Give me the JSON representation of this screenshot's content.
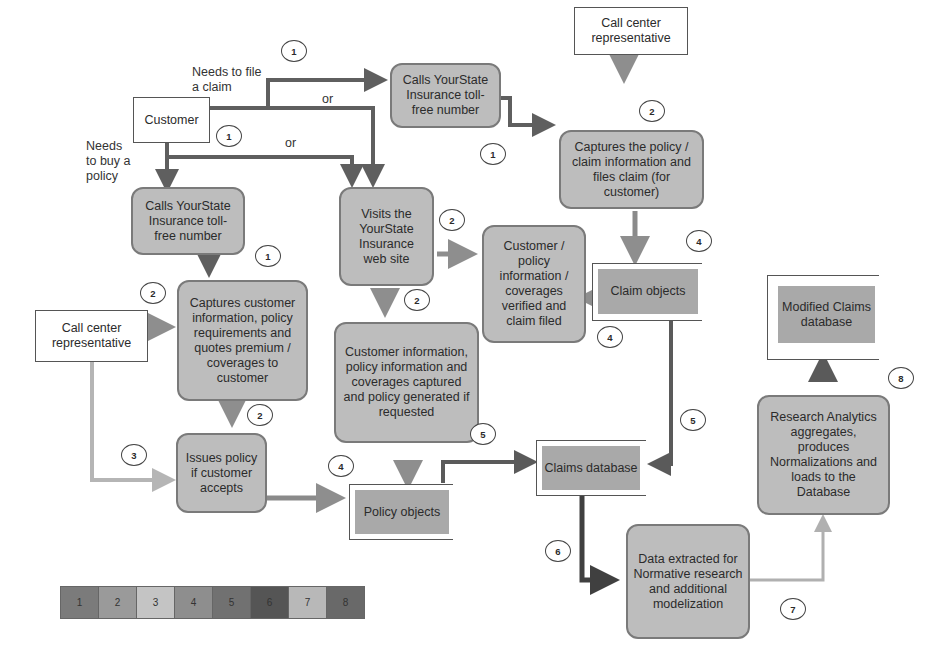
{
  "actors": {
    "customer": "Customer",
    "call_center_top": "Call center representative",
    "call_center_left": "Call center representative"
  },
  "labels": {
    "needs_claim": "Needs to file a claim",
    "needs_policy": "Needs to buy a policy",
    "or_top": "or",
    "or_bottom": "or"
  },
  "processes": {
    "calls_claim": "Calls YourState Insurance toll-free number",
    "captures_claim": "Captures the policy / claim information and files claim (for customer)",
    "calls_policy": "Calls YourState Insurance toll-free number",
    "visits_web": "Visits the YourState Insurance web site",
    "verified_claim": "Customer / policy information / coverages verified and claim filed",
    "captures_customer": "Captures customer information, policy requirements and quotes premium / coverages to customer",
    "web_captured": "Customer information, policy information and coverages captured and policy generated if requested",
    "issues_policy": "Issues policy if customer accepts",
    "data_extracted": "Data extracted for Normative research and additional modelization",
    "research_analytics": "Research Analytics aggregates, produces Normalizations and loads to the Database"
  },
  "stores": {
    "claim_objects": "Claim objects",
    "modified_claims": "Modified Claims database",
    "claims_database": "Claims database",
    "policy_objects": "Policy objects"
  },
  "step_markers": {
    "m1a": "1",
    "m1b": "1",
    "m1c": "1",
    "m1d": "1",
    "m2a": "2",
    "m2b": "2",
    "m2c": "2",
    "m2d": "2",
    "m2e": "2",
    "m3": "3",
    "m4a": "4",
    "m4b": "4",
    "m4c": "4",
    "m5a": "5",
    "m5b": "5",
    "m6": "6",
    "m7": "7",
    "m8": "8"
  },
  "legend": {
    "items": [
      {
        "label": "1",
        "color": "#7b7b7b"
      },
      {
        "label": "2",
        "color": "#9a9a9a"
      },
      {
        "label": "3",
        "color": "#c4c4c4"
      },
      {
        "label": "4",
        "color": "#8e8e8e"
      },
      {
        "label": "5",
        "color": "#717171"
      },
      {
        "label": "6",
        "color": "#555555"
      },
      {
        "label": "7",
        "color": "#b8b8b8"
      },
      {
        "label": "8",
        "color": "#696969"
      }
    ]
  }
}
